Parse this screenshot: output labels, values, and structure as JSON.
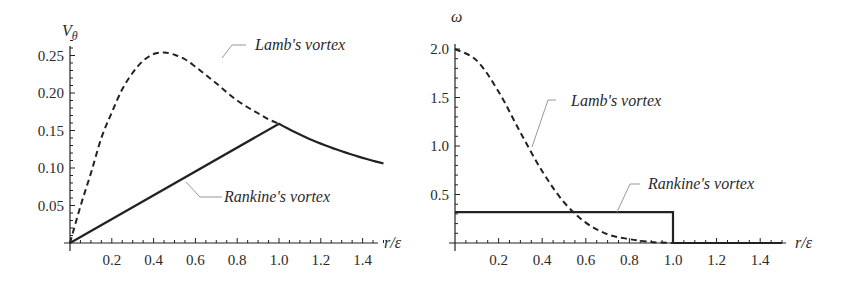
{
  "chart_data": [
    {
      "type": "line",
      "panel": "left",
      "title": "",
      "xlabel": "r/ε",
      "ylabel": "Vθ",
      "xlim": [
        0,
        1.5
      ],
      "ylim": [
        0,
        0.27
      ],
      "xticks": [
        "0.2",
        "0.4",
        "0.6",
        "0.8",
        "1.0",
        "1.2",
        "1.4"
      ],
      "yticks": [
        "0.05",
        "0.10",
        "0.15",
        "0.20",
        "0.25"
      ],
      "grid": false,
      "series": [
        {
          "name": "Lamb's vortex",
          "style": "dashed",
          "x": [
            0,
            0.05,
            0.1,
            0.15,
            0.2,
            0.25,
            0.3,
            0.35,
            0.4,
            0.45,
            0.5,
            0.55,
            0.6,
            0.65,
            0.7,
            0.75,
            0.8,
            0.85,
            0.9,
            0.95,
            1.0
          ],
          "values": [
            0,
            0.049,
            0.093,
            0.14,
            0.174,
            0.205,
            0.227,
            0.243,
            0.252,
            0.254,
            0.251,
            0.245,
            0.235,
            0.224,
            0.213,
            0.201,
            0.19,
            0.181,
            0.173,
            0.165,
            0.159
          ]
        },
        {
          "name": "Rankine's vortex",
          "style": "solid",
          "x": [
            0,
            1.0,
            1.1,
            1.2,
            1.3,
            1.4,
            1.5
          ],
          "values": [
            0,
            0.159,
            0.145,
            0.133,
            0.122,
            0.114,
            0.106
          ]
        }
      ],
      "annotations": [
        {
          "text": "Lamb's vortex",
          "target": "dashed curve"
        },
        {
          "text": "Rankine's vortex",
          "target": "solid curve"
        }
      ]
    },
    {
      "type": "line",
      "panel": "right",
      "title": "",
      "xlabel": "r/ε",
      "ylabel": "ω",
      "xlim": [
        0,
        1.5
      ],
      "ylim": [
        0,
        2.05
      ],
      "xticks": [
        "0.2",
        "0.4",
        "0.6",
        "0.8",
        "1.0",
        "1.2",
        "1.4"
      ],
      "yticks": [
        "0.5",
        "1.0",
        "1.5",
        "2.0"
      ],
      "grid": false,
      "series": [
        {
          "name": "Lamb's vortex",
          "style": "dashed",
          "x": [
            0,
            0.1,
            0.2,
            0.3,
            0.4,
            0.5,
            0.6,
            0.7,
            0.8,
            0.9,
            1.0
          ],
          "values": [
            2.0,
            1.88,
            1.56,
            1.14,
            0.74,
            0.42,
            0.21,
            0.09,
            0.04,
            0.01,
            0.0
          ]
        },
        {
          "name": "Rankine's vortex",
          "style": "solid",
          "x": [
            0,
            1.0,
            1.0,
            1.5
          ],
          "values": [
            0.318,
            0.318,
            0,
            0
          ]
        }
      ],
      "annotations": [
        {
          "text": "Lamb's vortex",
          "target": "dashed curve"
        },
        {
          "text": "Rankine's vortex",
          "target": "solid curve"
        }
      ]
    }
  ],
  "left": {
    "ylabel_main": "V",
    "ylabel_sub": "θ",
    "xlabel": "r/ε",
    "lamb_label": "Lamb's vortex",
    "rankine_label": "Rankine's vortex"
  },
  "right": {
    "ylabel": "ω",
    "xlabel": "r/ε",
    "lamb_label": "Lamb's vortex",
    "rankine_label": "Rankine's vortex"
  }
}
